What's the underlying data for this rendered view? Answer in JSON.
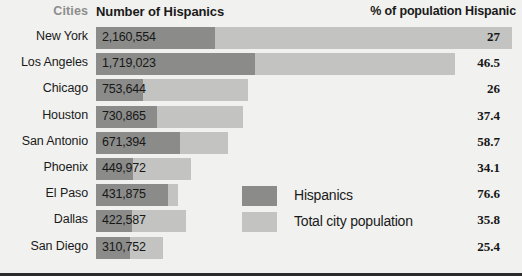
{
  "header": {
    "cities_label": "Cities",
    "number_label": "Number of Hispanics",
    "percent_label": "% of population Hispanic"
  },
  "legend": {
    "items": [
      {
        "key": "hispanics",
        "label": "Hispanics",
        "color": "#8b8c8a"
      },
      {
        "key": "total",
        "label": "Total city population",
        "color": "#c3c4c2"
      }
    ]
  },
  "colors": {
    "background": "#f1f1ef",
    "hispanic_bar": "#8b8c8a",
    "total_bar": "#c3c4c2",
    "text": "#1a1a1a",
    "muted_text": "#8d8d8d",
    "bottom_border": "#2b2b2b"
  },
  "chart_data": {
    "type": "bar",
    "title": "",
    "subtitle": "",
    "xlabel": "",
    "ylabel": "Cities",
    "orientation": "horizontal",
    "grid": false,
    "legend_position": "inside-center-bottom",
    "categories": [
      "New York",
      "Los Angeles",
      "Chicago",
      "Houston",
      "San Antonio",
      "Phoenix",
      "El Paso",
      "Dallas",
      "San Diego"
    ],
    "series": [
      {
        "name": "Hispanics",
        "color": "#8b8c8a",
        "values": [
          2160554,
          1719023,
          753644,
          730865,
          671394,
          449972,
          431875,
          422587,
          310752
        ],
        "value_labels": [
          "2,160,554",
          "1,719,023",
          "753,644",
          "730,865",
          "671,394",
          "449,972",
          "431,875",
          "422,587",
          "310,752"
        ]
      },
      {
        "name": "Total city population",
        "color": "#c3c4c2",
        "values": [
          8002032,
          3697104,
          2898867,
          1954243,
          1143691,
          1319462,
          563655,
          1180361,
          1223402
        ]
      }
    ],
    "percent_hispanic": {
      "label": "% of population Hispanic",
      "values": [
        27,
        46.5,
        26,
        37.4,
        58.7,
        34.1,
        76.6,
        35.8,
        25.4
      ],
      "value_labels": [
        "27",
        "46.5",
        "26",
        "37.4",
        "58.7",
        "34.1",
        "76.6",
        "35.8",
        "25.4"
      ]
    },
    "bar_pixels": {
      "note": "rendered pixel widths from the source figure",
      "hispanic": [
        119,
        159,
        47,
        61,
        84,
        37,
        72,
        36,
        34
      ],
      "total": [
        416,
        359,
        152,
        147,
        132,
        95,
        82,
        90,
        67
      ]
    }
  }
}
